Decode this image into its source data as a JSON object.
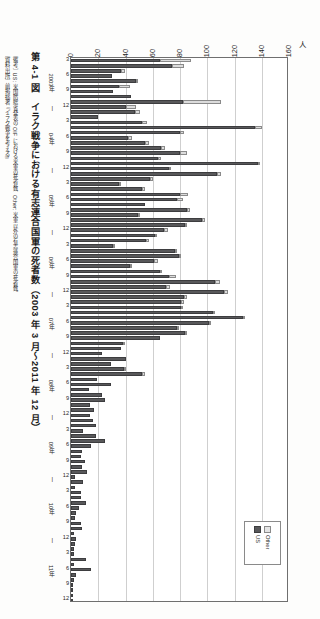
{
  "figure": {
    "title": "第 4-1 図　イラク戦争における有志連合国軍の死者数（2003 年 3 月～2011 年 12 月）",
    "note_label": "［備考］",
    "note_text": "US: 米国防総省発表の OIF における米軍の死者数、Other: 米軍以外の有志連合国軍の死者数。",
    "source_label": "［資料出所］",
    "source_text": "前掲拙著『イラク戦争を考える』",
    "unit": "人"
  },
  "legend": {
    "position": "bottom-right",
    "entries": [
      {
        "key": "other",
        "label": "Other",
        "color": "#e4e4e4"
      },
      {
        "key": "us",
        "label": "US",
        "color": "#58585a"
      }
    ]
  },
  "chart_data": {
    "type": "bar",
    "orientation": "horizontal",
    "stacked": true,
    "title": "第 4-1 図　イラク戦争における有志連合国軍の死者数（2003 年 3 月～2011 年 12 月）",
    "xlabel": "人",
    "ylabel": "",
    "xlim": [
      0,
      160
    ],
    "xticks": [
      0,
      20,
      40,
      60,
      80,
      100,
      120,
      140,
      160
    ],
    "grid": true,
    "year_labels": [
      "2003年",
      "04年",
      "05年",
      "06年",
      "07年",
      "08年",
      "09年",
      "10年",
      "11年"
    ],
    "month_ticks": [
      3,
      6,
      9,
      12
    ],
    "categories": [
      "2003-03",
      "2003-04",
      "2003-05",
      "2003-06",
      "2003-07",
      "2003-08",
      "2003-09",
      "2003-10",
      "2003-11",
      "2003-12",
      "2004-01",
      "2004-02",
      "2004-03",
      "2004-04",
      "2004-05",
      "2004-06",
      "2004-07",
      "2004-08",
      "2004-09",
      "2004-10",
      "2004-11",
      "2004-12",
      "2005-01",
      "2005-02",
      "2005-03",
      "2005-04",
      "2005-05",
      "2005-06",
      "2005-07",
      "2005-08",
      "2005-09",
      "2005-10",
      "2005-11",
      "2005-12",
      "2006-01",
      "2006-02",
      "2006-03",
      "2006-04",
      "2006-05",
      "2006-06",
      "2006-07",
      "2006-08",
      "2006-09",
      "2006-10",
      "2006-11",
      "2006-12",
      "2007-01",
      "2007-02",
      "2007-03",
      "2007-04",
      "2007-05",
      "2007-06",
      "2007-07",
      "2007-08",
      "2007-09",
      "2007-10",
      "2007-11",
      "2007-12",
      "2008-01",
      "2008-02",
      "2008-03",
      "2008-04",
      "2008-05",
      "2008-06",
      "2008-07",
      "2008-08",
      "2008-09",
      "2008-10",
      "2008-11",
      "2008-12",
      "2009-01",
      "2009-02",
      "2009-03",
      "2009-04",
      "2009-05",
      "2009-06",
      "2009-07",
      "2009-08",
      "2009-09",
      "2009-10",
      "2009-11",
      "2009-12",
      "2010-01",
      "2010-02",
      "2010-03",
      "2010-04",
      "2010-05",
      "2010-06",
      "2010-07",
      "2010-08",
      "2010-09",
      "2010-10",
      "2010-11",
      "2010-12",
      "2011-01",
      "2011-02",
      "2011-03",
      "2011-04",
      "2011-05",
      "2011-06",
      "2011-07",
      "2011-08",
      "2011-09",
      "2011-10",
      "2011-11",
      "2011-12"
    ],
    "series": [
      {
        "name": "US",
        "color": "#58585a",
        "values": [
          65,
          74,
          37,
          30,
          48,
          35,
          31,
          44,
          82,
          40,
          47,
          20,
          52,
          135,
          80,
          42,
          54,
          66,
          80,
          64,
          137,
          72,
          107,
          58,
          35,
          52,
          80,
          78,
          54,
          85,
          49,
          96,
          84,
          68,
          62,
          55,
          31,
          76,
          79,
          61,
          43,
          65,
          72,
          106,
          70,
          112,
          83,
          81,
          81,
          104,
          126,
          101,
          78,
          84,
          65,
          38,
          37,
          23,
          40,
          29,
          39,
          52,
          19,
          29,
          13,
          23,
          25,
          14,
          17,
          14,
          16,
          18,
          9,
          18,
          25,
          15,
          8,
          7,
          10,
          8,
          12,
          3,
          9,
          3,
          7,
          7,
          11,
          6,
          4,
          3,
          7,
          8,
          2,
          4,
          3,
          2,
          2,
          11,
          2,
          15,
          4,
          2,
          1,
          0,
          0,
          0
        ]
      },
      {
        "name": "Other",
        "color": "#e4e4e4",
        "values": [
          23,
          9,
          3,
          0,
          1,
          8,
          0,
          0,
          28,
          8,
          4,
          0,
          4,
          5,
          3,
          3,
          3,
          3,
          5,
          2,
          2,
          1,
          3,
          2,
          2,
          2,
          6,
          4,
          0,
          2,
          1,
          2,
          1,
          3,
          1,
          2,
          1,
          2,
          2,
          3,
          2,
          1,
          5,
          3,
          3,
          3,
          2,
          2,
          1,
          2,
          2,
          2,
          1,
          1,
          0,
          1,
          0,
          0,
          0,
          0,
          1,
          2,
          0,
          0,
          0,
          0,
          0,
          0,
          0,
          0,
          0,
          0,
          0,
          0,
          0,
          0,
          0,
          0,
          0,
          0,
          0,
          0,
          0,
          0,
          0,
          0,
          0,
          0,
          0,
          0,
          0,
          0,
          0,
          0,
          0,
          0,
          0,
          0,
          0,
          0,
          0,
          0,
          0,
          0,
          0,
          0
        ]
      }
    ]
  }
}
